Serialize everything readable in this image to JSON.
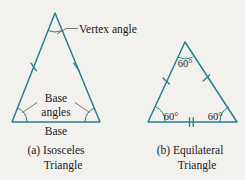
{
  "figure": {
    "background_color": "#f2f1ee",
    "stroke_color": "#27808f",
    "text_color": "#1a1a1a",
    "leader_color": "#5a5a5a"
  },
  "panel_a": {
    "caption_line1": "(a)  Isosceles",
    "caption_line2": "Triangle",
    "annotations": {
      "vertex_angle": "Vertex angle",
      "base_angles_line1": "Base",
      "base_angles_line2": "angles",
      "base": "Base"
    },
    "geometry": {
      "apex": [
        55,
        13
      ],
      "base_left": [
        12,
        122
      ],
      "base_right": [
        100,
        122
      ],
      "leg_tick_count": 1,
      "base_tick_count": 0
    }
  },
  "panel_b": {
    "caption_line1": "(b)  Equilateral",
    "caption_line2": "Triangle",
    "angles": {
      "apex": "60°",
      "base_left": "60°",
      "base_right": "60°"
    },
    "geometry": {
      "apex": [
        185,
        42
      ],
      "base_left": [
        148,
        122
      ],
      "base_right": [
        237,
        122
      ],
      "leg_tick_count": 1,
      "base_tick_count": 2
    }
  }
}
